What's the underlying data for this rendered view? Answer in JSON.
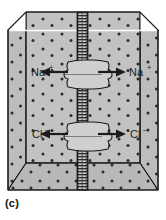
{
  "figure": {
    "caption": "(c)",
    "panel_letter": "c"
  },
  "labels": {
    "sodium_left": "Na",
    "sodium_left_charge": "+",
    "sodium_right": "Na",
    "sodium_right_charge": "+",
    "chloride_left": "Cl",
    "chloride_left_charge": "–",
    "chloride_right": "Cl",
    "chloride_right_charge": "–"
  },
  "colors": {
    "solution_fill": "#bdbdbd",
    "solution_fill_front": "#c4c4c4",
    "solution_fill_floor": "#b5b5b5",
    "particle": "#2b2b2b",
    "outline": "#1a1a1a",
    "membrane_dark": "#3a3a3a",
    "membrane_light": "#d8d8d8",
    "channel_fill": "#cfcfcf",
    "arrow": "#1c1c1c",
    "highlight_line": "#ffffff",
    "background": "#ffffff"
  },
  "structures": {
    "container_name": "chamber",
    "membrane_name": "lipid-bilayer-membrane",
    "upper_channel_name": "sodium-channel-protein",
    "lower_channel_name": "chloride-channel-protein"
  },
  "arrows": {
    "sodium_left_direction": "left",
    "sodium_right_direction": "right",
    "chloride_left_direction": "left",
    "chloride_right_direction": "right"
  },
  "geometry": {
    "width": 166,
    "height": 220,
    "membrane_x": 83,
    "upper_channel_y": 72,
    "lower_channel_y": 134
  }
}
